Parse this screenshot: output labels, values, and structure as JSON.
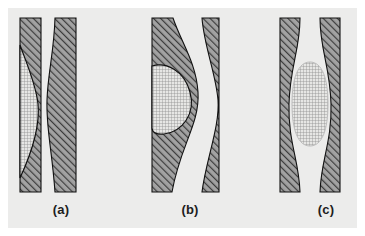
{
  "figure": {
    "background_color": "#ffffff",
    "plate_color": "#ececeb",
    "outline_color": "#111111",
    "hatch_color": "#4a4a4a",
    "hatch_fill_color": "#9b9b9b",
    "stipple_color": "#7d7d7d",
    "stipple_fill_color": "#e2e2e0",
    "panels": [
      {
        "id": "a",
        "caption": "(a)",
        "description": "Crescent-shaped stippled inclusion along the inner edge of the left hatched band; right band has a wavy inner edge",
        "bands": [
          {
            "name": "left-band",
            "hatch": "diagonal-forward"
          },
          {
            "name": "right-band",
            "hatch": "diagonal-forward"
          }
        ],
        "inclusion": {
          "name": "crescent-inclusion",
          "fill": "stipple-grid"
        }
      },
      {
        "id": "b",
        "caption": "(b)",
        "description": "Lens-shaped stippled inclusion bulging rightward out of the left hatched band; right band pinches inward at mid-height",
        "bands": [
          {
            "name": "left-band",
            "hatch": "diagonal-forward"
          },
          {
            "name": "right-band",
            "hatch": "diagonal-forward"
          }
        ],
        "inclusion": {
          "name": "lens-inclusion",
          "fill": "stipple-grid"
        }
      },
      {
        "id": "c",
        "caption": "(c)",
        "description": "Symmetric oval stippled inclusion centered in the gap; both hatched bands bow outward around it",
        "bands": [
          {
            "name": "left-band",
            "hatch": "diagonal-forward"
          },
          {
            "name": "right-band",
            "hatch": "diagonal-forward"
          }
        ],
        "inclusion": {
          "name": "oval-inclusion",
          "fill": "stipple-grid"
        }
      }
    ]
  }
}
